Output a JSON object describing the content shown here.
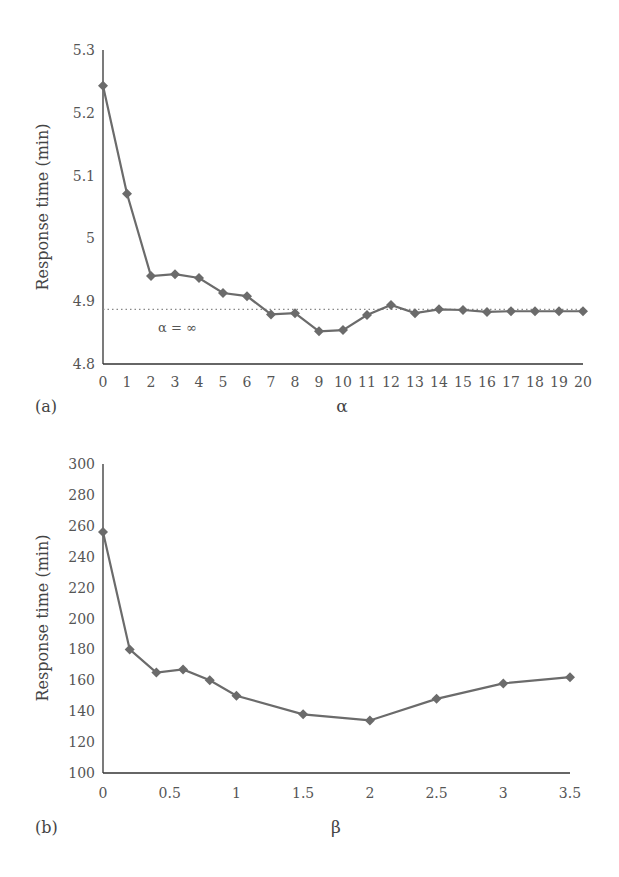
{
  "chart_data": [
    {
      "type": "line",
      "panel_label": "(a)",
      "title": "",
      "xlabel": "α",
      "ylabel": "Response time (min)",
      "x": [
        0,
        1,
        2,
        3,
        4,
        5,
        6,
        7,
        8,
        9,
        10,
        11,
        12,
        13,
        14,
        15,
        16,
        17,
        18,
        19,
        20
      ],
      "x_ticks": [
        "0",
        "1",
        "2",
        "3",
        "4",
        "5",
        "6",
        "7",
        "8",
        "9",
        "10",
        "11",
        "12",
        "13",
        "14",
        "15",
        "16",
        "17",
        "18",
        "19",
        "20"
      ],
      "y_ticks": [
        "4.8",
        "4.9",
        "5",
        "5.1",
        "5.2",
        "5.3"
      ],
      "ylim": [
        4.8,
        5.3
      ],
      "xlim": [
        0,
        20
      ],
      "grid": false,
      "series": [
        {
          "name": "Response time",
          "marker": "diamond",
          "color": "#6b6b6b",
          "values": [
            5.243,
            5.071,
            4.94,
            4.943,
            4.937,
            4.913,
            4.908,
            4.879,
            4.881,
            4.852,
            4.854,
            4.878,
            4.894,
            4.881,
            4.887,
            4.886,
            4.883,
            4.884,
            4.884,
            4.884,
            4.884
          ]
        }
      ],
      "reference_line": {
        "y": 4.887,
        "style": "dotted",
        "label": "α = ∞"
      }
    },
    {
      "type": "line",
      "panel_label": "(b)",
      "title": "",
      "xlabel": "β",
      "ylabel": "Response time (min)",
      "x": [
        0,
        0.2,
        0.4,
        0.6,
        0.8,
        1,
        1.5,
        2,
        2.5,
        3,
        3.5
      ],
      "x_ticks": [
        "0",
        "0.5",
        "1",
        "1.5",
        "2",
        "2.5",
        "3",
        "3.5"
      ],
      "y_ticks": [
        "100",
        "120",
        "140",
        "160",
        "180",
        "200",
        "220",
        "240",
        "260",
        "280",
        "300"
      ],
      "ylim": [
        100,
        300
      ],
      "xlim": [
        0,
        3.5
      ],
      "grid": false,
      "series": [
        {
          "name": "Response time",
          "marker": "diamond",
          "color": "#6b6b6b",
          "values": [
            256,
            180,
            165,
            167,
            160,
            150,
            138,
            134,
            148,
            158,
            162
          ]
        }
      ]
    }
  ]
}
